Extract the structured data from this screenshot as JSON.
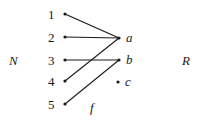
{
  "diagram": {
    "domain_label": "N",
    "codomain_label": "R",
    "function_label": "f",
    "domain_elements": [
      "1",
      "2",
      "3",
      "4",
      "5"
    ],
    "codomain_elements": [
      "a",
      "b",
      "c"
    ],
    "mappings": [
      {
        "from": "1",
        "to": "a"
      },
      {
        "from": "2",
        "to": "a"
      },
      {
        "from": "3",
        "to": "b"
      },
      {
        "from": "4",
        "to": "a"
      },
      {
        "from": "5",
        "to": "b"
      }
    ],
    "colors": {
      "ink": "#1a1a1a",
      "background": "#ffffff"
    }
  }
}
